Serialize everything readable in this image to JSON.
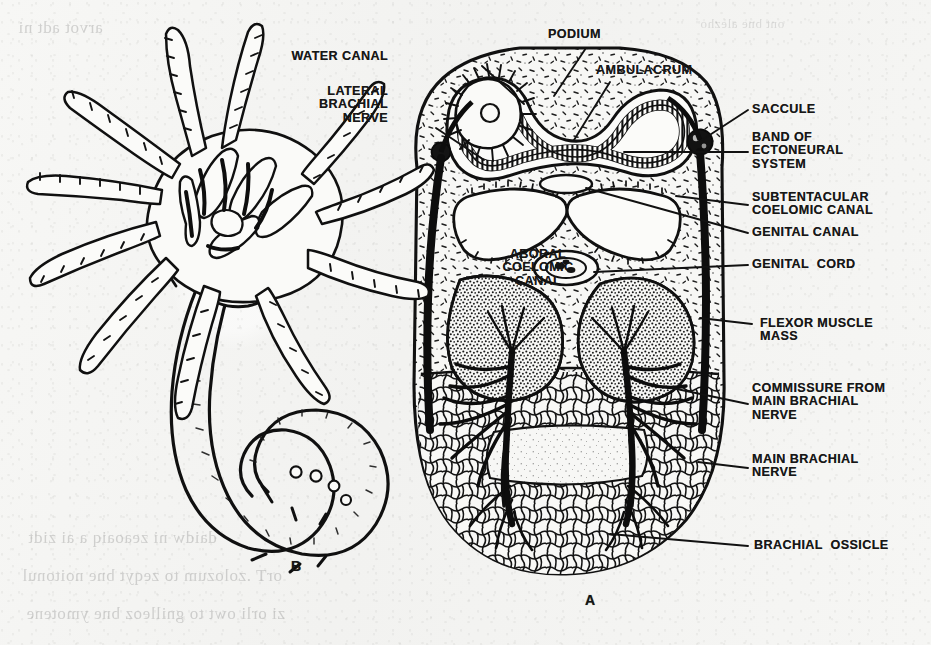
{
  "figure": {
    "caption_a": "A",
    "caption_b": "B",
    "background_color": "#f5f5f3",
    "ink_color": "#151515"
  },
  "labels": {
    "water_canal": "WATER CANAL",
    "podium": "PODIUM",
    "ambulacrum": "AMBULACRUM",
    "lateral_brachial_nerve": "LATERAL\nBRACHIAL\nNERVE",
    "saccule": "SACCULE",
    "band_of_ectoneural_system": "BAND OF\nECTONEURAL\nSYSTEM",
    "subtentacular_coelomic_canal": "SUBTENTACULAR\nCOELOMIC CANAL",
    "genital_canal": "GENITAL CANAL",
    "genital_cord": "GENITAL  CORD",
    "aboral_coelomic_canal": "ABORAL\nCOELOMIC\nCANAL",
    "flexor_muscle_mass": "FLEXOR MUSCLE\nMASS",
    "commissure_from_main_brachial_nerve": "COMMISSURE FROM\nMAIN BRACHIAL\nNERVE",
    "main_brachial_nerve": "MAIN BRACHIAL\nNERVE",
    "brachial_ossicle": "BRACHIAL  OSSICLE"
  },
  "ghost_text": {
    "line1": "arvot adt ni",
    "line2": "ont bne alezho",
    "line3": "daidw ni zeaoaiq a ai zidt",
    "line4": "orT .zolozum to zeqyt bne noitonul",
    "line5": "zi orli owt to gnilleoz bne ymotene"
  }
}
